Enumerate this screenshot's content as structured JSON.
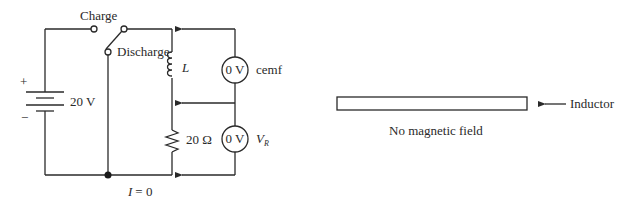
{
  "circuit": {
    "switch": {
      "charge_label": "Charge",
      "discharge_label": "Discharge"
    },
    "battery": {
      "plus_sign": "+",
      "minus_sign": "−",
      "voltage_label": "20 V"
    },
    "inductor": {
      "label": "L"
    },
    "resistor": {
      "label": "20 Ω"
    },
    "meters": {
      "cemf": {
        "reading": "0 V",
        "label": "cemf"
      },
      "vr": {
        "reading": "0 V",
        "label_main": "V",
        "label_sub": "R"
      }
    },
    "current_label": "I = 0",
    "current_symbol": "I",
    "current_value": "= 0"
  },
  "inductor_view": {
    "arrow_label": "Inductor",
    "caption": "No magnetic field"
  },
  "colors": {
    "line": "#2a2a2a",
    "background": "#ffffff"
  }
}
